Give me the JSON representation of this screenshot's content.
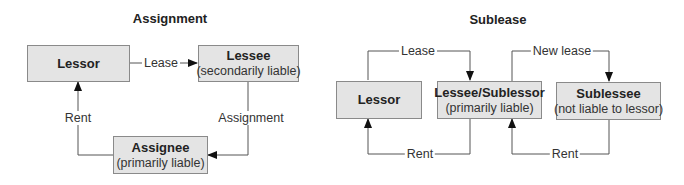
{
  "assignment": {
    "title": "Assignment",
    "boxes": {
      "lessor": {
        "name": "Lessor",
        "sub": ""
      },
      "lessee": {
        "name": "Lessee",
        "sub": "(secondarily liable)"
      },
      "assignee": {
        "name": "Assignee",
        "sub": "(primarily liable)"
      }
    },
    "arrows": {
      "lease": "Lease",
      "assignment": "Assignment",
      "rent": "Rent"
    }
  },
  "sublease": {
    "title": "Sublease",
    "boxes": {
      "lessor": {
        "name": "Lessor",
        "sub": ""
      },
      "sublessor": {
        "name": "Lessee/Sublessor",
        "sub": "(primarily liable)"
      },
      "sublessee": {
        "name": "Sublessee",
        "sub": "(not liable to lessor)"
      }
    },
    "arrows": {
      "lease": "Lease",
      "new_lease": "New lease",
      "rent_1": "Rent",
      "rent_2": "Rent"
    }
  },
  "colors": {
    "box_fill": "#e4e4e4",
    "box_border": "#8a8a8a",
    "line": "#555555",
    "arrowhead": "#111111"
  }
}
